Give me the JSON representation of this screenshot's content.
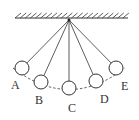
{
  "diagram": {
    "pivot": {
      "x": 69,
      "y": 20
    },
    "ceiling": {
      "x1": 15,
      "x2": 128,
      "y": 18,
      "hatch_count": 22
    },
    "ball_radius": 7,
    "path_style": "dashed",
    "colors": {
      "stroke": "#333333",
      "background": "#ffffff"
    },
    "positions": [
      {
        "label": "A",
        "cx": 22,
        "cy": 68,
        "lx": 11,
        "ly": 89
      },
      {
        "label": "B",
        "cx": 41,
        "cy": 82,
        "lx": 35,
        "ly": 104
      },
      {
        "label": "C",
        "cx": 69,
        "cy": 88,
        "lx": 68,
        "ly": 112
      },
      {
        "label": "D",
        "cx": 96,
        "cy": 81,
        "lx": 100,
        "ly": 103
      },
      {
        "label": "E",
        "cx": 116,
        "cy": 68,
        "lx": 121,
        "ly": 90
      }
    ]
  }
}
